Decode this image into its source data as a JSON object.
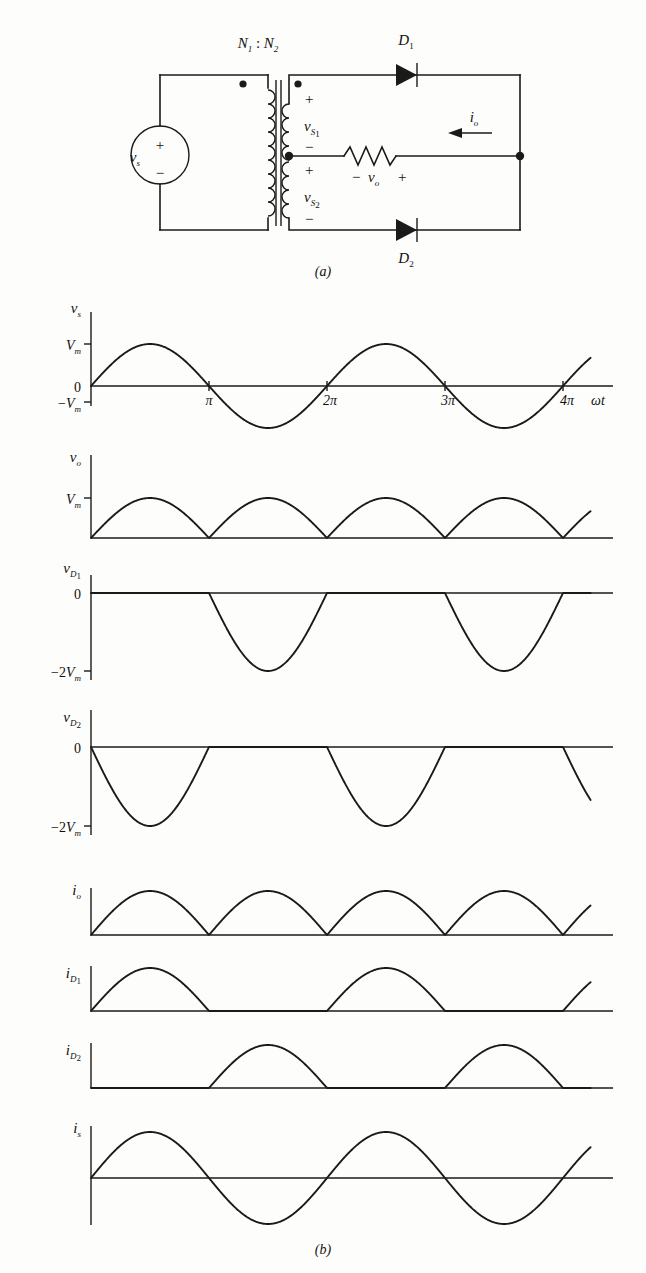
{
  "figure": {
    "caption_a": "(a)",
    "caption_b": "(b)",
    "line_color": "#1a1a1a",
    "background": "#fdfdfb"
  },
  "circuit": {
    "source_label": "v",
    "source_label_sub": "s",
    "source_plus": "+",
    "source_minus": "−",
    "turns_ratio": "N",
    "turns_ratio_sub1": "1",
    "turns_ratio_colon": " : ",
    "turns_ratio_n2": "N",
    "turns_ratio_sub2": "2",
    "secondary_top_label": "v",
    "secondary_top_sub": "S",
    "secondary_top_sub_idx": "1",
    "secondary_top_plus": "+",
    "secondary_top_minus": "−",
    "secondary_bot_label": "v",
    "secondary_bot_sub": "S",
    "secondary_bot_sub_idx": "2",
    "secondary_bot_plus": "+",
    "secondary_bot_minus": "−",
    "diode1": "D",
    "diode1_sub": "1",
    "diode2": "D",
    "diode2_sub": "2",
    "output_current": "i",
    "output_current_sub": "o",
    "output_voltage": "v",
    "output_voltage_sub": "o",
    "output_voltage_minus": "−",
    "output_voltage_plus": "+",
    "dot_marker": "dot",
    "resistor": "resistor"
  },
  "axis": {
    "omega_t": "ωt",
    "ticks": [
      "π",
      "2π",
      "3π",
      "4π"
    ],
    "tick_values": [
      3.14159,
      6.28318,
      9.42478,
      12.56637
    ],
    "zero": "0",
    "vm": "V",
    "vm_sub": "m",
    "neg_vm": "−V",
    "neg_2vm": "−2V"
  },
  "chart_data": [
    {
      "type": "line",
      "name": "vs",
      "title": "v",
      "title_sub": "s",
      "ylabel": "v_s",
      "xlabel": "ωt",
      "xlim": [
        0,
        13.6
      ],
      "ylim": [
        -1,
        1
      ],
      "ytick_labels": [
        "V_m",
        "0",
        "−V_m"
      ],
      "ytick_values": [
        1,
        0,
        -1
      ],
      "xtick_labels": [
        "π",
        "2π",
        "3π",
        "4π"
      ],
      "xtick_values": [
        3.14159,
        6.28318,
        9.42478,
        12.56637
      ],
      "expression": "sin(wt)",
      "axis_style": "full",
      "grid": false,
      "description": "Sinusoidal source voltage, amplitude Vm, two full cycles from 0 to 4π"
    },
    {
      "type": "line",
      "name": "vo",
      "title": "v",
      "title_sub": "o",
      "ylabel": "v_o",
      "xlim": [
        0,
        13.6
      ],
      "ylim": [
        0,
        1
      ],
      "ytick_labels": [
        "V_m"
      ],
      "ytick_values": [
        1
      ],
      "expression": "|sin(wt)|",
      "axis_style": "quadrant",
      "grid": false,
      "description": "Full-wave rectified output voltage, four positive humps of amplitude Vm"
    },
    {
      "type": "line",
      "name": "vD1",
      "title": "v",
      "title_sub": "D1",
      "ylabel": "v_D1",
      "xlim": [
        0,
        13.6
      ],
      "ylim": [
        -2,
        0
      ],
      "ytick_labels": [
        "0",
        "−2V_m"
      ],
      "ytick_values": [
        0,
        -2
      ],
      "expression": "0 for 0<wt<pi ; 2*sin(wt) for pi<wt<2pi (repeating)",
      "axis_style": "quadrant",
      "grid": false,
      "description": "Diode D1 voltage: zero during conduction, negative half-sine of amplitude 2Vm when reverse-biased"
    },
    {
      "type": "line",
      "name": "vD2",
      "title": "v",
      "title_sub": "D2",
      "ylabel": "v_D2",
      "xlim": [
        0,
        13.6
      ],
      "ylim": [
        -2,
        0
      ],
      "ytick_labels": [
        "0",
        "−2V_m"
      ],
      "ytick_values": [
        0,
        -2
      ],
      "expression": "-2*sin(wt) for 0<wt<pi ; 0 for pi<wt<2pi (repeating)",
      "axis_style": "quadrant",
      "grid": false,
      "description": "Diode D2 voltage: negative half-sine of amplitude 2Vm during first half cycle, then zero"
    },
    {
      "type": "line",
      "name": "io",
      "title": "i",
      "title_sub": "o",
      "ylabel": "i_o",
      "xlim": [
        0,
        13.6
      ],
      "ylim": [
        0,
        1
      ],
      "ytick_labels": [],
      "ytick_values": [],
      "expression": "|sin(wt)|",
      "axis_style": "quadrant",
      "grid": false,
      "description": "Output current, full-wave rectified, four positive humps"
    },
    {
      "type": "line",
      "name": "iD1",
      "title": "i",
      "title_sub": "D1",
      "ylabel": "i_D1",
      "xlim": [
        0,
        13.6
      ],
      "ylim": [
        0,
        1
      ],
      "ytick_labels": [],
      "ytick_values": [],
      "expression": "sin(wt) for 0<wt<pi ; 0 for pi<wt<2pi (repeating)",
      "axis_style": "quadrant",
      "grid": false,
      "description": "Diode D1 current: positive half-sine during first and third half cycles"
    },
    {
      "type": "line",
      "name": "iD2",
      "title": "i",
      "title_sub": "D2",
      "ylabel": "i_D2",
      "xlim": [
        0,
        13.6
      ],
      "ylim": [
        0,
        1
      ],
      "ytick_labels": [],
      "ytick_values": [],
      "expression": "0 for 0<wt<pi ; -sin(wt) for pi<wt<2pi (repeating)",
      "axis_style": "quadrant",
      "grid": false,
      "description": "Diode D2 current: positive half-sine during second and fourth half cycles"
    },
    {
      "type": "line",
      "name": "is",
      "title": "i",
      "title_sub": "s",
      "ylabel": "i_s",
      "xlim": [
        0,
        13.6
      ],
      "ylim": [
        -1,
        1
      ],
      "ytick_labels": [],
      "ytick_values": [],
      "expression": "sin(wt)",
      "axis_style": "quadrant-bipolar",
      "grid": false,
      "description": "Source current, sinusoidal, two full cycles"
    }
  ]
}
